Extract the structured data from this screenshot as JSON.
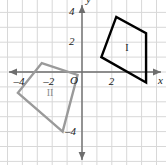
{
  "figure": {
    "grid": {
      "visible": true,
      "color": "#d8d8d8",
      "spacing_units": 1,
      "xrange": [
        -5.4,
        5.6
      ],
      "yrange": [
        -6.0,
        5.3
      ]
    },
    "axes": {
      "color": "#6e6e6e",
      "x_label": "x",
      "y_label": "y",
      "origin_label": "O",
      "x_ticks": [
        {
          "value": -4,
          "label": "–4"
        },
        {
          "value": -2,
          "label": "–2"
        },
        {
          "value": 2,
          "label": "2"
        }
      ],
      "y_ticks": [
        {
          "value": 4,
          "label": "4"
        },
        {
          "value": 2,
          "label": "2"
        },
        {
          "value": -4,
          "label": "–4"
        }
      ]
    },
    "shapes": [
      {
        "id": "shape-1",
        "label": "I",
        "color": "#000000",
        "stroke_width": 2.4,
        "label_point": [
          3.1,
          1.6
        ],
        "vertices": [
          [
            1.3,
            1.0
          ],
          [
            2.3,
            3.7
          ],
          [
            4.3,
            2.6
          ],
          [
            4.3,
            -0.7
          ]
        ]
      },
      {
        "id": "shape-2",
        "label": "II",
        "color": "#9a9a9a",
        "stroke_width": 2.4,
        "label_point": [
          -2.1,
          -1.4
        ],
        "vertices": [
          [
            -2.7,
            0.6
          ],
          [
            -0.3,
            -0.2
          ],
          [
            -1.3,
            -4.0
          ],
          [
            -4.3,
            -1.4
          ]
        ]
      }
    ]
  },
  "chart_data": {
    "type": "scatter",
    "xlabel": "x",
    "ylabel": "y",
    "xlim": [
      -5.4,
      5.6
    ],
    "ylim": [
      -6.0,
      5.3
    ],
    "grid": true,
    "legend": "none",
    "xticks": [
      -4,
      -2,
      2
    ],
    "xticklabels": [
      "–4",
      "–2",
      "2"
    ],
    "yticks": [
      4,
      2,
      -4
    ],
    "yticklabels": [
      "4",
      "2",
      "–4"
    ],
    "series": [
      {
        "name": "I",
        "color": "#000000",
        "closed": true,
        "x": [
          1.3,
          2.3,
          4.3,
          4.3
        ],
        "y": [
          1.0,
          3.7,
          2.6,
          -0.7
        ]
      },
      {
        "name": "II",
        "color": "#9a9a9a",
        "closed": true,
        "x": [
          -2.7,
          -0.3,
          -1.3,
          -4.3
        ],
        "y": [
          0.6,
          -0.2,
          -4.0,
          -1.4
        ]
      }
    ],
    "annotations": [
      {
        "text": "I",
        "x": 3.1,
        "y": 1.6,
        "color": "#000000"
      },
      {
        "text": "II",
        "x": -2.1,
        "y": -1.4,
        "color": "#9a9a9a"
      },
      {
        "text": "O",
        "x": -0.45,
        "y": -0.45,
        "color": "#1a1a1a"
      }
    ]
  }
}
